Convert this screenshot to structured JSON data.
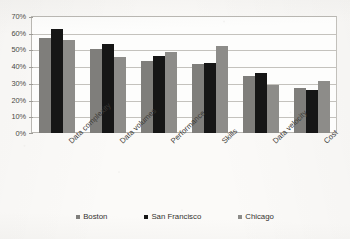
{
  "chart_data": {
    "type": "bar",
    "title": "",
    "subtitle": "",
    "xlabel": "",
    "ylabel": "",
    "categories": [
      "Data complexity",
      "Data volumes",
      "Performance",
      "Skills",
      "Data velocity",
      "Cost"
    ],
    "series": [
      {
        "name": "Boston",
        "color": "#7f7e7b",
        "values": [
          57,
          50.5,
          43,
          41,
          34,
          27
        ]
      },
      {
        "name": "San Francisco",
        "color": "#161616",
        "values": [
          62,
          53,
          46,
          42,
          36,
          26
        ]
      },
      {
        "name": "Chicago",
        "color": "#8d8c89",
        "values": [
          55.5,
          45.5,
          48.5,
          52,
          29,
          31
        ]
      }
    ],
    "ylim": [
      0,
      70
    ],
    "ytick_step": 10,
    "ytick_labels": [
      "70%",
      "60%",
      "50%",
      "40%",
      "30%",
      "20%",
      "10%",
      "0%"
    ],
    "ytick_values": [
      70,
      60,
      50,
      40,
      30,
      20,
      10,
      0
    ],
    "value_suffix": "%",
    "grid": true,
    "grid_axis": "y",
    "legend_position": "bottom",
    "legend_entries": [
      "Boston",
      "San Francisco",
      "Chicago"
    ],
    "bar_orientation": "vertical",
    "grouping": "clustered",
    "xtick_label_rotation": -44
  }
}
